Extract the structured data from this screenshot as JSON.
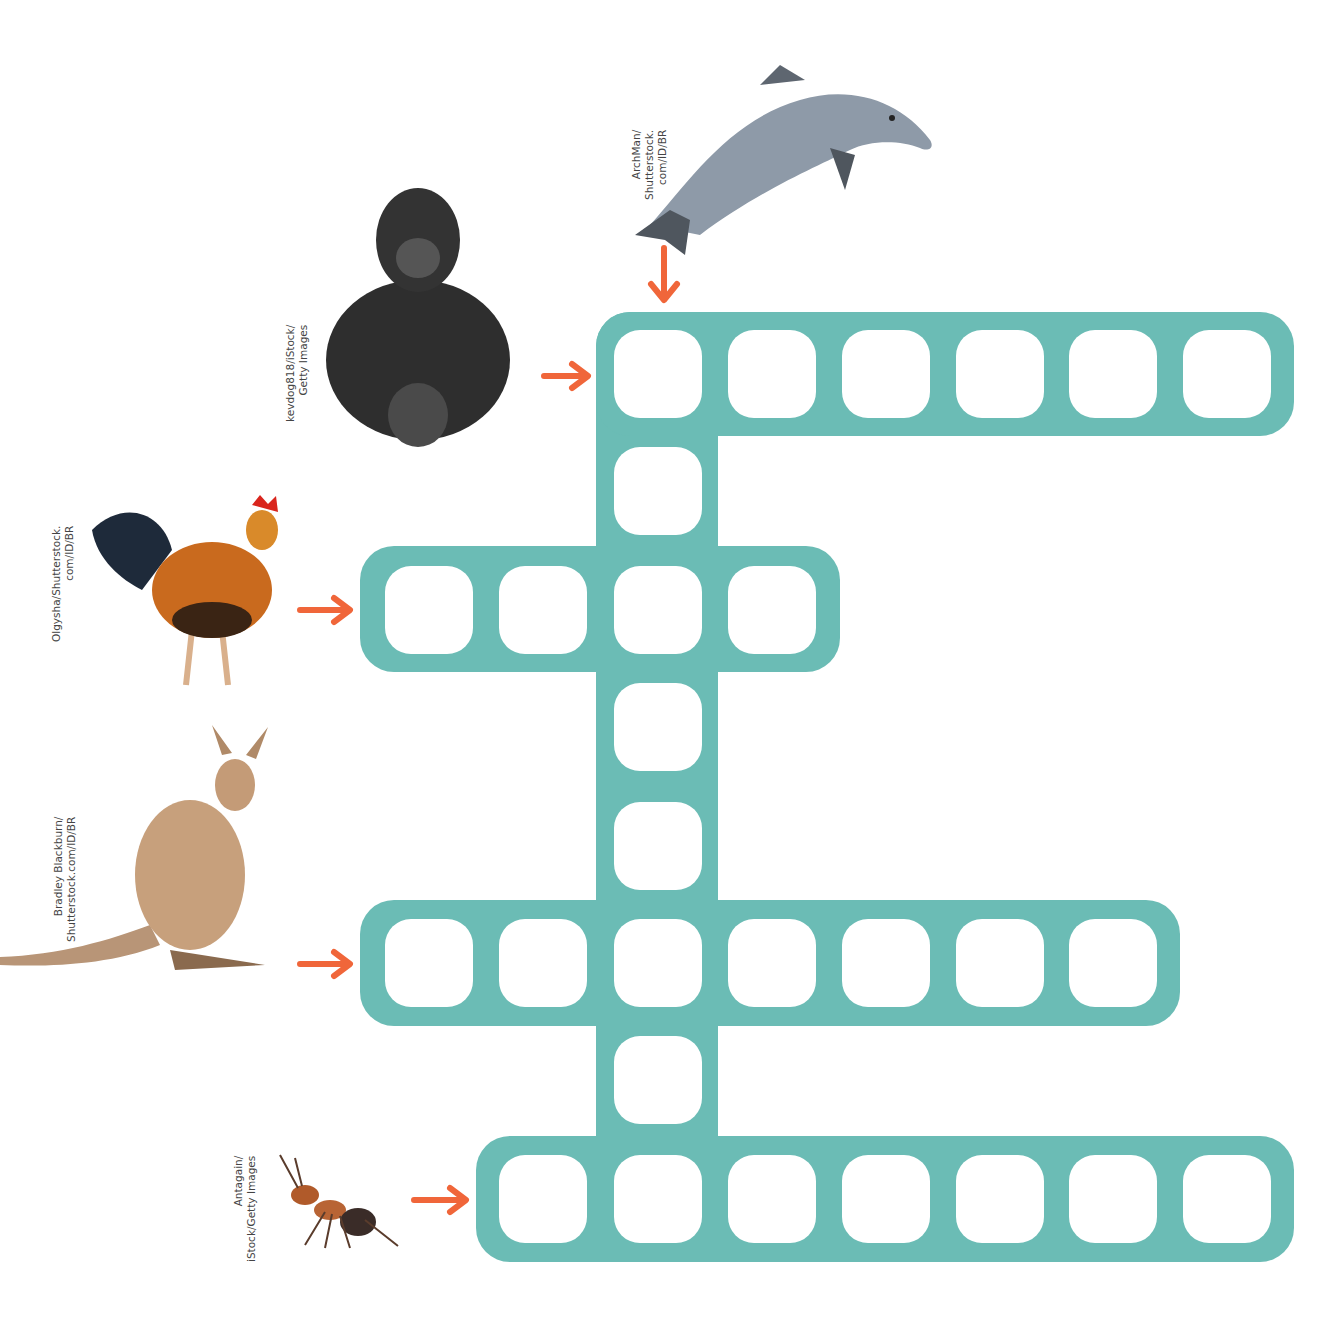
{
  "puzzle": {
    "type": "crossword",
    "theme_color": "#6bbcb5",
    "arrow_color": "#f0663a",
    "clues": [
      {
        "id": "dolphin",
        "animal": "dolphin",
        "direction": "down",
        "start_row": 0,
        "start_col": 2,
        "length": 8,
        "credit": [
          "ArchMan/",
          "Shutterstock.",
          "com/ID/BR"
        ]
      },
      {
        "id": "gorilla",
        "animal": "gorilla",
        "direction": "across",
        "start_row": 0,
        "start_col": 2,
        "length": 6,
        "credit": [
          "kevdog818/iStock/",
          "Getty Images"
        ]
      },
      {
        "id": "rooster",
        "animal": "rooster",
        "direction": "across",
        "start_row": 2,
        "start_col": 0,
        "length": 4,
        "credit": [
          "Olgysha/Shutterstock.",
          "com/ID/BR"
        ]
      },
      {
        "id": "kangaroo",
        "animal": "kangaroo",
        "direction": "across",
        "start_row": 5,
        "start_col": 0,
        "length": 7,
        "credit": [
          "Bradley Blackburn/",
          "Shutterstock.com/ID/BR"
        ]
      },
      {
        "id": "ant",
        "animal": "ant",
        "direction": "across",
        "start_row": 7,
        "start_col": 1,
        "length": 7,
        "credit": [
          "Antagain/",
          "iStock/Getty Images"
        ]
      }
    ]
  },
  "credits": {
    "dolphin": [
      "ArchMan/",
      "Shutterstock.",
      "com/ID/BR"
    ],
    "gorilla": [
      "kevdog818/iStock/",
      "Getty Images"
    ],
    "rooster": [
      "Olgysha/Shutterstock.",
      "com/ID/BR"
    ],
    "kangaroo": [
      "Bradley Blackburn/",
      "Shutterstock.com/ID/BR"
    ],
    "ant": [
      "Antagain/",
      "iStock/Getty Images"
    ]
  },
  "icons": {
    "dolphin": "dolphin-image",
    "gorilla": "gorilla-image",
    "rooster": "rooster-image",
    "kangaroo": "kangaroo-image",
    "ant": "ant-image",
    "arrow": "arrow-icon"
  }
}
